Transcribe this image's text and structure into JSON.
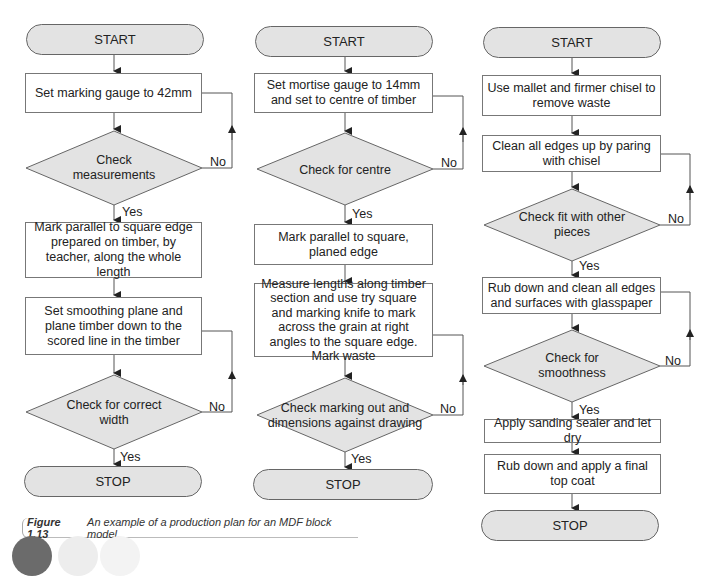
{
  "figure": {
    "caption_label": "Figure 1.13",
    "caption_text": "An example of a production plan for an MDF block model."
  },
  "columns": [
    {
      "start": "START",
      "step1": "Set marking gauge to 42mm",
      "decision1": "Check measurements",
      "decision1_no": "No",
      "decision1_yes": "Yes",
      "step2": "Mark parallel to square edge prepared on timber, by teacher, along the whole length",
      "step3": "Set smoothing plane and plane timber down to the scored line in the timber",
      "decision2": "Check for correct width",
      "decision2_no": "No",
      "decision2_yes": "Yes",
      "stop": "STOP"
    },
    {
      "start": "START",
      "step1": "Set mortise gauge to 14mm and set to centre of timber",
      "decision1": "Check for centre",
      "decision1_no": "No",
      "decision1_yes": "Yes",
      "step2": "Mark parallel to square, planed edge",
      "step3": "Measure lengths along timber section and use try square and marking knife to mark across the grain at right angles to the square edge. Mark waste",
      "decision2": "Check marking out and dimensions against drawing",
      "decision2_no": "No",
      "decision2_yes": "Yes",
      "stop": "STOP"
    },
    {
      "start": "START",
      "step1": "Use mallet and firmer chisel to remove waste",
      "step2": "Clean all edges up by paring with chisel",
      "decision1": "Check fit with other pieces",
      "decision1_no": "No",
      "decision1_yes": "Yes",
      "step3": "Rub down and clean all edges and surfaces with glasspaper",
      "decision2": "Check for smoothness",
      "decision2_no": "No",
      "decision2_yes": "Yes",
      "step4": "Apply sanding sealer and let dry",
      "step5": "Rub down and apply a final top coat",
      "stop": "STOP"
    }
  ],
  "colors": {
    "terminal_fill": "#e3e3e3",
    "decision_fill": "#e3e3e3",
    "line": "#555555"
  }
}
